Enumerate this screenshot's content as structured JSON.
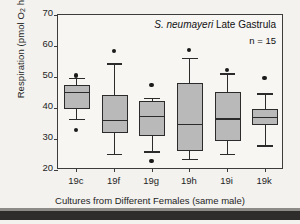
{
  "chart_data": {
    "type": "box",
    "title": "S. neumayeri Late Gastrula",
    "title_species": "S. neumayeri",
    "title_rest": " Late Gastrula",
    "annotation_n": "n = 15",
    "xlabel": "Cultures from Different Females (same male)",
    "ylabel_text": "Respiration (pmol O2 h-1 embryo-1)",
    "ylabel_parts": {
      "prefix": "Respiration (pmol O",
      "sub1": "2",
      "mid": " h",
      "sup1": "-1",
      "mid2": " embryo",
      "sup2": "-1",
      "suffix": ")"
    },
    "ylim": [
      20,
      70
    ],
    "yticks": [
      70,
      60,
      50,
      40,
      30,
      20
    ],
    "grid": false,
    "legend": "none",
    "categories": [
      "19c",
      "19f",
      "19g",
      "19h",
      "19i",
      "19k"
    ],
    "boxes": [
      {
        "category": "19c",
        "whisker_high": 49.5,
        "q3": 47.5,
        "median": 45.0,
        "q1": 39.8,
        "whisker_low": 36.3,
        "outliers": [
          50.5,
          32.8
        ]
      },
      {
        "category": "19f",
        "whisker_high": 54.2,
        "q3": 44.3,
        "median": 36.0,
        "q1": 31.8,
        "whisker_low": 25.0,
        "outliers": [
          58.5
        ]
      },
      {
        "category": "19g",
        "whisker_high": 43.0,
        "q3": 42.3,
        "median": 37.2,
        "q1": 31.1,
        "whisker_low": 25.8,
        "outliers": [
          47.5,
          22.8
        ]
      },
      {
        "category": "19h",
        "whisker_high": 56.0,
        "q3": 48.0,
        "median": 34.7,
        "q1": 26.0,
        "whisker_low": 23.3,
        "outliers": [
          58.8
        ]
      },
      {
        "category": "19i",
        "whisker_high": 51.0,
        "q3": 45.2,
        "median": 36.5,
        "q1": 29.3,
        "whisker_low": 25.0,
        "outliers": [
          52.3
        ]
      },
      {
        "category": "19k",
        "whisker_high": 44.5,
        "q3": 39.8,
        "median": 37.0,
        "q1": 34.4,
        "whisker_low": 27.8,
        "outliers": [
          49.7
        ]
      }
    ],
    "colors": {
      "box_fill": "#b9b9b9",
      "line": "#2b2b2b",
      "frame": "#3c3c3c",
      "background": "#f7f6f3"
    }
  }
}
